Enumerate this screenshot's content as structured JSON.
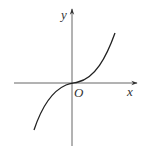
{
  "diagram": {
    "type": "function-graph",
    "labels": {
      "y_axis": "y",
      "x_axis": "x",
      "origin": "O"
    },
    "colors": {
      "axis": "#555555",
      "curve": "#222222",
      "text": "#333333"
    }
  }
}
